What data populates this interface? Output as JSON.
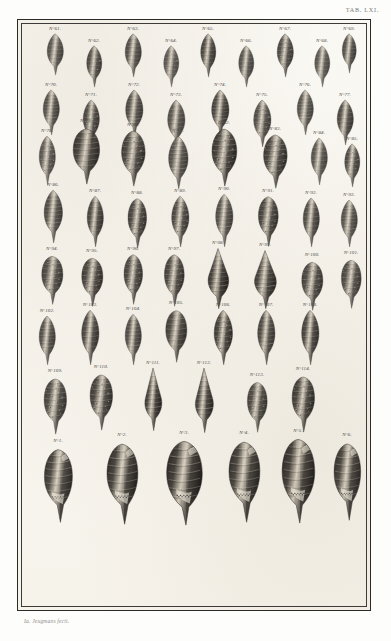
{
  "document": {
    "type": "engraved-plate",
    "plate_caption": "TAB. LXI.",
    "signature": "Ia. Jeugmans fecit.",
    "paper_color": "#fbfaf7",
    "ink_color": "#221f1c",
    "border_color": "#2b2a27",
    "label_prefix": "N°"
  },
  "plate": {
    "rows": [
      {
        "row_index": 1,
        "figures": [
          {
            "label": "N°61.",
            "x": 22,
            "y": 6,
            "w": 30,
            "h": 44,
            "shell": "fusiform-ribbed",
            "tone": 0.78
          },
          {
            "label": "N°62.",
            "x": 62,
            "y": 18,
            "w": 28,
            "h": 44,
            "shell": "fusiform-nodose",
            "tone": 0.82
          },
          {
            "label": "N°63.",
            "x": 100,
            "y": 6,
            "w": 30,
            "h": 46,
            "shell": "fusiform-ribbed",
            "tone": 0.8
          },
          {
            "label": "N°64.",
            "x": 139,
            "y": 18,
            "w": 28,
            "h": 44,
            "shell": "fusiform-nodose",
            "tone": 0.76
          },
          {
            "label": "N°65.",
            "x": 176,
            "y": 6,
            "w": 28,
            "h": 46,
            "shell": "fusiform-spindle",
            "tone": 0.84
          },
          {
            "label": "N°66.",
            "x": 214,
            "y": 18,
            "w": 28,
            "h": 44,
            "shell": "fusiform-ribbed",
            "tone": 0.79
          },
          {
            "label": "N°67.",
            "x": 252,
            "y": 6,
            "w": 30,
            "h": 46,
            "shell": "fusiform-nodose",
            "tone": 0.83
          },
          {
            "label": "N°68.",
            "x": 290,
            "y": 18,
            "w": 28,
            "h": 44,
            "shell": "fusiform-spindle",
            "tone": 0.77
          },
          {
            "label": "N°69.",
            "x": 318,
            "y": 6,
            "w": 26,
            "h": 42,
            "shell": "fusiform-ribbed",
            "tone": 0.81
          }
        ]
      },
      {
        "row_index": 2,
        "figures": [
          {
            "label": "N°70.",
            "x": 18,
            "y": 62,
            "w": 30,
            "h": 48,
            "shell": "fusiform-banded",
            "tone": 0.8
          },
          {
            "label": "N°71.",
            "x": 58,
            "y": 72,
            "w": 30,
            "h": 48,
            "shell": "fusiform-nodose",
            "tone": 0.84
          },
          {
            "label": "N°72.",
            "x": 100,
            "y": 62,
            "w": 32,
            "h": 50,
            "shell": "fusiform-banded",
            "tone": 0.82
          },
          {
            "label": "N°73.",
            "x": 142,
            "y": 72,
            "w": 32,
            "h": 50,
            "shell": "fusiform-ribbed",
            "tone": 0.78
          },
          {
            "label": "N°74.",
            "x": 186,
            "y": 62,
            "w": 32,
            "h": 50,
            "shell": "fusiform-banded",
            "tone": 0.85
          },
          {
            "label": "N°75.",
            "x": 228,
            "y": 72,
            "w": 32,
            "h": 50,
            "shell": "fusiform-nodose",
            "tone": 0.81
          },
          {
            "label": "N°76.",
            "x": 272,
            "y": 62,
            "w": 30,
            "h": 48,
            "shell": "fusiform-banded",
            "tone": 0.79
          },
          {
            "label": "N°77.",
            "x": 312,
            "y": 72,
            "w": 30,
            "h": 48,
            "shell": "fusiform-ribbed",
            "tone": 0.83
          }
        ]
      },
      {
        "row_index": 3,
        "figures": [
          {
            "label": "N°78.",
            "x": 14,
            "y": 108,
            "w": 30,
            "h": 52,
            "shell": "fusiform-nodose",
            "tone": 0.76
          },
          {
            "label": "N°79.",
            "x": 48,
            "y": 98,
            "w": 40,
            "h": 62,
            "shell": "ovate-large",
            "tone": 0.88
          },
          {
            "label": "N°80.",
            "x": 96,
            "y": 102,
            "w": 38,
            "h": 60,
            "shell": "nodose-heavy",
            "tone": 0.86
          },
          {
            "label": "N°81.",
            "x": 142,
            "y": 108,
            "w": 36,
            "h": 56,
            "shell": "fusiform-banded",
            "tone": 0.8
          },
          {
            "label": "N°82.",
            "x": 186,
            "y": 100,
            "w": 40,
            "h": 62,
            "shell": "nodose-heavy",
            "tone": 0.89
          },
          {
            "label": "N°83.",
            "x": 238,
            "y": 106,
            "w": 38,
            "h": 58,
            "shell": "nodose-heavy",
            "tone": 0.87
          },
          {
            "label": "N°84.",
            "x": 286,
            "y": 110,
            "w": 30,
            "h": 50,
            "shell": "fusiform-ribbed",
            "tone": 0.78
          },
          {
            "label": "N°85.",
            "x": 320,
            "y": 116,
            "w": 28,
            "h": 46,
            "shell": "fusiform-nodose",
            "tone": 0.82
          }
        ]
      },
      {
        "row_index": 4,
        "figures": [
          {
            "label": "N°86.",
            "x": 18,
            "y": 162,
            "w": 34,
            "h": 56,
            "shell": "fusiform-banded",
            "tone": 0.81
          },
          {
            "label": "N°87.",
            "x": 62,
            "y": 168,
            "w": 30,
            "h": 54,
            "shell": "fusiform-ribbed",
            "tone": 0.84
          },
          {
            "label": "N°88.",
            "x": 104,
            "y": 170,
            "w": 30,
            "h": 54,
            "shell": "nodose-heavy",
            "tone": 0.85
          },
          {
            "label": "N°89.",
            "x": 146,
            "y": 168,
            "w": 32,
            "h": 54,
            "shell": "fusiform-nodose",
            "tone": 0.83
          },
          {
            "label": "N°90.",
            "x": 190,
            "y": 166,
            "w": 32,
            "h": 56,
            "shell": "fusiform-banded",
            "tone": 0.8
          },
          {
            "label": "N°91.",
            "x": 234,
            "y": 168,
            "w": 32,
            "h": 54,
            "shell": "nodose-heavy",
            "tone": 0.86
          },
          {
            "label": "N°92.",
            "x": 278,
            "y": 170,
            "w": 30,
            "h": 52,
            "shell": "fusiform-ribbed",
            "tone": 0.82
          },
          {
            "label": "N°93.",
            "x": 316,
            "y": 172,
            "w": 30,
            "h": 50,
            "shell": "fusiform-banded",
            "tone": 0.79
          }
        ]
      },
      {
        "row_index": 5,
        "figures": [
          {
            "label": "N°94.",
            "x": 18,
            "y": 226,
            "w": 32,
            "h": 54,
            "shell": "ovate-rugose",
            "tone": 0.83
          },
          {
            "label": "N°95.",
            "x": 58,
            "y": 228,
            "w": 32,
            "h": 54,
            "shell": "ovate-granulate",
            "tone": 0.86
          },
          {
            "label": "N°96.",
            "x": 100,
            "y": 226,
            "w": 30,
            "h": 54,
            "shell": "nodose-heavy",
            "tone": 0.84
          },
          {
            "label": "N°97.",
            "x": 140,
            "y": 226,
            "w": 32,
            "h": 56,
            "shell": "nodose-heavy",
            "tone": 0.85
          },
          {
            "label": "N°98.",
            "x": 182,
            "y": 220,
            "w": 36,
            "h": 64,
            "shell": "conic-broad",
            "tone": 0.9
          },
          {
            "label": "N°99.",
            "x": 228,
            "y": 222,
            "w": 38,
            "h": 62,
            "shell": "conic-fan",
            "tone": 0.88
          },
          {
            "label": "N°100.",
            "x": 278,
            "y": 232,
            "w": 32,
            "h": 54,
            "shell": "ovate-granulate",
            "tone": 0.84
          },
          {
            "label": "N°101.",
            "x": 318,
            "y": 230,
            "w": 30,
            "h": 54,
            "shell": "ovate-rugose",
            "tone": 0.82
          }
        ]
      },
      {
        "row_index": 6,
        "figures": [
          {
            "label": "N°102.",
            "x": 14,
            "y": 288,
            "w": 30,
            "h": 52,
            "shell": "fusiform-banded",
            "tone": 0.8
          },
          {
            "label": "N°103.",
            "x": 56,
            "y": 282,
            "w": 32,
            "h": 58,
            "shell": "fusiform-ribbed",
            "tone": 0.84
          },
          {
            "label": "N°104.",
            "x": 100,
            "y": 286,
            "w": 30,
            "h": 54,
            "shell": "fusiform-banded",
            "tone": 0.81
          },
          {
            "label": "N°105.",
            "x": 142,
            "y": 280,
            "w": 32,
            "h": 58,
            "shell": "ovate-ribbed",
            "tone": 0.85
          },
          {
            "label": "N°106.",
            "x": 188,
            "y": 282,
            "w": 34,
            "h": 58,
            "shell": "fusiform-checkered",
            "tone": 0.87
          },
          {
            "label": "N°107.",
            "x": 232,
            "y": 282,
            "w": 32,
            "h": 58,
            "shell": "fusiform-banded",
            "tone": 0.83
          },
          {
            "label": "N°108.",
            "x": 276,
            "y": 282,
            "w": 32,
            "h": 58,
            "shell": "fusiform-ribbed",
            "tone": 0.85
          }
        ]
      },
      {
        "row_index": 7,
        "figures": [
          {
            "label": "N°109.",
            "x": 20,
            "y": 348,
            "w": 34,
            "h": 62,
            "shell": "ovate-granulate",
            "tone": 0.84
          },
          {
            "label": "N°110.",
            "x": 66,
            "y": 344,
            "w": 34,
            "h": 62,
            "shell": "ovate-checkered",
            "tone": 0.86
          },
          {
            "label": "N°111.",
            "x": 118,
            "y": 340,
            "w": 34,
            "h": 66,
            "shell": "turret-tall",
            "tone": 0.89
          },
          {
            "label": "N°112.",
            "x": 168,
            "y": 340,
            "w": 36,
            "h": 68,
            "shell": "turret-tall",
            "tone": 0.88
          },
          {
            "label": "N°113.",
            "x": 224,
            "y": 352,
            "w": 30,
            "h": 56,
            "shell": "ovate-granulate",
            "tone": 0.83
          },
          {
            "label": "N°114.",
            "x": 268,
            "y": 346,
            "w": 34,
            "h": 62,
            "shell": "ovate-rugose",
            "tone": 0.87
          }
        ]
      },
      {
        "row_index": 8,
        "figures": [
          {
            "label": "N°1.",
            "x": 20,
            "y": 418,
            "w": 40,
            "h": 80,
            "shell": "conch-spouted",
            "tone": 0.88
          },
          {
            "label": "N°2.",
            "x": 82,
            "y": 412,
            "w": 44,
            "h": 88,
            "shell": "conch-spouted",
            "tone": 0.9
          },
          {
            "label": "N°3.",
            "x": 142,
            "y": 410,
            "w": 48,
            "h": 90,
            "shell": "conch-smooth",
            "tone": 0.92
          },
          {
            "label": "N°4.",
            "x": 204,
            "y": 410,
            "w": 44,
            "h": 88,
            "shell": "conch-ribbed",
            "tone": 0.89
          },
          {
            "label": "N°5.",
            "x": 258,
            "y": 408,
            "w": 44,
            "h": 90,
            "shell": "conch-smooth",
            "tone": 0.91
          },
          {
            "label": "N°6.",
            "x": 310,
            "y": 412,
            "w": 38,
            "h": 84,
            "shell": "conch-ribbed",
            "tone": 0.88
          }
        ]
      }
    ]
  }
}
